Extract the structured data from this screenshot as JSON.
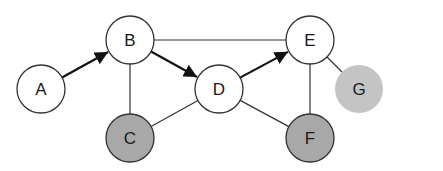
{
  "diagram": {
    "type": "graph",
    "nodes": [
      {
        "id": "A",
        "label": "A",
        "x": 41,
        "y": 89,
        "fill": "#ffffff",
        "stroke": "#333333"
      },
      {
        "id": "B",
        "label": "B",
        "x": 130,
        "y": 40,
        "fill": "#ffffff",
        "stroke": "#333333"
      },
      {
        "id": "C",
        "label": "C",
        "x": 130,
        "y": 138,
        "fill": "#a8a8a8",
        "stroke": "#333333"
      },
      {
        "id": "D",
        "label": "D",
        "x": 219,
        "y": 89,
        "fill": "#ffffff",
        "stroke": "#333333"
      },
      {
        "id": "E",
        "label": "E",
        "x": 310,
        "y": 40,
        "fill": "#ffffff",
        "stroke": "#333333"
      },
      {
        "id": "F",
        "label": "F",
        "x": 310,
        "y": 138,
        "fill": "#a8a8a8",
        "stroke": "#333333"
      },
      {
        "id": "G",
        "label": "G",
        "x": 359,
        "y": 89,
        "fill": "#c4c4c4",
        "stroke": "none"
      }
    ],
    "edges": [
      {
        "from": "A",
        "to": "B",
        "directed": true
      },
      {
        "from": "B",
        "to": "D",
        "directed": true
      },
      {
        "from": "D",
        "to": "E",
        "directed": true
      },
      {
        "from": "B",
        "to": "E",
        "directed": false
      },
      {
        "from": "B",
        "to": "C",
        "directed": false
      },
      {
        "from": "C",
        "to": "D",
        "directed": false
      },
      {
        "from": "D",
        "to": "F",
        "directed": false
      },
      {
        "from": "E",
        "to": "F",
        "directed": false
      },
      {
        "from": "E",
        "to": "G",
        "directed": false
      }
    ]
  }
}
